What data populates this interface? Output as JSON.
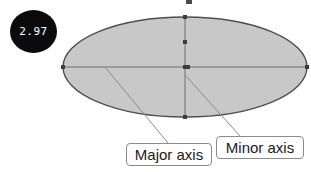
{
  "canvas": {
    "width": 311,
    "height": 172,
    "background": "#ffffff"
  },
  "badge": {
    "name": "scale-badge",
    "value": "2.97",
    "fill": "#0b0b0b",
    "text_color": "#ffffff",
    "shape": "circle"
  },
  "diagram": {
    "title_shape": "ellipse",
    "ellipse": {
      "center_x": 185,
      "center_y": 67,
      "radius_x": 122,
      "radius_y": 50,
      "fill": "#c8c8c8",
      "stroke": "#4f4f4f",
      "stroke_width": 1.4
    },
    "axes": [
      {
        "name": "major-axis",
        "orientation": "horizontal",
        "x1": 63,
        "y1": 67,
        "x2": 307,
        "y2": 67,
        "stroke": "#6e6e6e"
      },
      {
        "name": "minor-axis",
        "orientation": "vertical",
        "x1": 185,
        "y1": 17,
        "x2": 185,
        "y2": 117,
        "stroke": "#6e6e6e"
      }
    ],
    "handles": [
      {
        "x": 63,
        "y": 67
      },
      {
        "x": 307,
        "y": 67
      },
      {
        "x": 185,
        "y": 17
      },
      {
        "x": 185,
        "y": 117
      },
      {
        "x": 185,
        "y": 67
      },
      {
        "x": 185,
        "y": 42
      }
    ],
    "top_marker": {
      "x": 186,
      "y": 0,
      "width": 6,
      "height": 4,
      "fill": "#4a4a4a"
    }
  },
  "callouts": [
    {
      "name": "major-axis-callout",
      "label": "Major axis",
      "leader": {
        "x1": 105,
        "y1": 67,
        "x2": 168,
        "y2": 143
      },
      "stroke": "#8c8c8c"
    },
    {
      "name": "minor-axis-callout",
      "label": "Minor axis",
      "leader": {
        "x1": 185,
        "y1": 75,
        "x2": 240,
        "y2": 136
      },
      "stroke": "#8c8c8c"
    }
  ],
  "colors": {
    "ellipse_fill": "#c8c8c8",
    "ellipse_stroke": "#4f4f4f",
    "axis_line": "#6e6e6e",
    "callout_border": "#8c8c8c",
    "badge_fill": "#0b0b0b",
    "text": "#1a1a1a"
  }
}
